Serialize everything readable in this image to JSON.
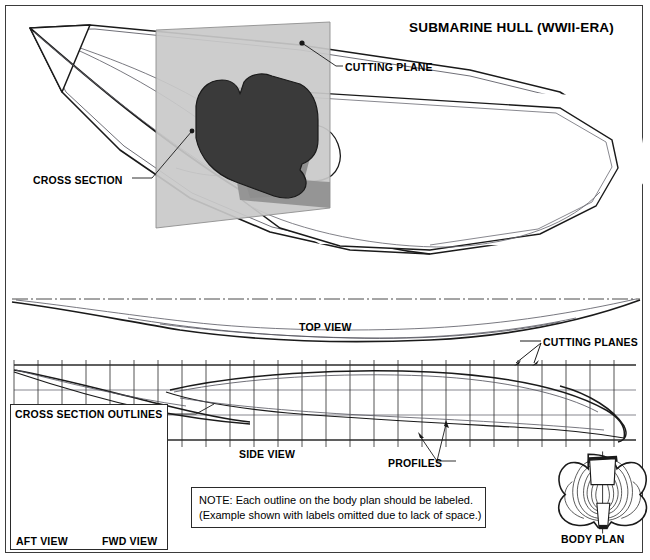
{
  "drawing": {
    "title": "SUBMARINE HULL (WWII-ERA)",
    "subject": "submarine hull lines drawing",
    "sheet": {
      "width": 650,
      "height": 560,
      "background": "#ffffff",
      "border_color": "#3b3b3b"
    }
  },
  "labels": {
    "cutting_plane": "CUTTING PLANE",
    "cross_section": "CROSS SECTION",
    "top_view": "TOP VIEW",
    "cutting_planes": "CUTTING PLANES",
    "side_view": "SIDE VIEW",
    "profiles": "PROFILES",
    "body_plan": "BODY PLAN",
    "cross_section_outlines": "CROSS SECTION OUTLINES",
    "aft_view": "AFT VIEW",
    "fwd_view": "FWD VIEW"
  },
  "note": {
    "line1": "NOTE: Each outline on the body plan should be labeled.",
    "line2": "(Example shown with labels omitted due to lack of space.)"
  },
  "colors": {
    "line": "#1a1a1a",
    "thin_line": "#55555f",
    "cutting_plane_fill": "#c9c9c9",
    "cross_section_fill": "#3a3a3a",
    "shadow_fill": "#8f8f8f",
    "hull_fill": "#ffffff",
    "frame": "#3b3b3b"
  },
  "views": {
    "perspective": {
      "name": "cutaway perspective",
      "bow_direction": "left",
      "has_cutting_plane": true
    },
    "top": {
      "name": "half-breadth plan",
      "centerline": true
    },
    "side": {
      "name": "sheer plan",
      "station_lines": 26,
      "waterlines": 4
    },
    "body_plan_left": {
      "name": "cross section outlines",
      "halves": [
        "aft",
        "fwd"
      ]
    },
    "body_plan_right": {
      "name": "body plan"
    }
  }
}
